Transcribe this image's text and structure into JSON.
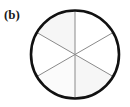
{
  "figure": {
    "panel_label": "(b)",
    "caption_text": "(b)",
    "background_color": "#ffffff"
  },
  "diagram": {
    "shape": "circle-divided-into-six-sectors",
    "center_x": 75,
    "center_y": 54.5,
    "radius": 44,
    "outline_color": "#111111",
    "outline_width": 2.6,
    "divider_color": "#8a8a8a",
    "divider_width": 1,
    "sector_count": 6,
    "sector_angle_degrees": 60,
    "divider_angles_degrees": [
      30,
      90,
      150
    ],
    "sectors": [
      {
        "name": "sector-top-right",
        "start_deg": 30,
        "end_deg": 90,
        "fill": "#ffffff"
      },
      {
        "name": "sector-top-left",
        "start_deg": 90,
        "end_deg": 150,
        "fill": "#f6f6f6"
      },
      {
        "name": "sector-left",
        "start_deg": 150,
        "end_deg": 210,
        "fill": "#ffffff"
      },
      {
        "name": "sector-bottom-left",
        "start_deg": 210,
        "end_deg": 270,
        "fill": "#fbfbfb"
      },
      {
        "name": "sector-bottom-right",
        "start_deg": 270,
        "end_deg": 330,
        "fill": "#f6f6f6"
      },
      {
        "name": "sector-right",
        "start_deg": 330,
        "end_deg": 390,
        "fill": "#ffffff"
      }
    ]
  }
}
